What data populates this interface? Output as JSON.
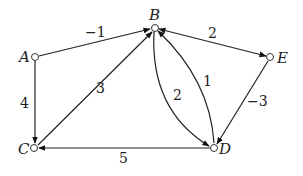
{
  "diagram": {
    "type": "directed weighted graph",
    "nodes": [
      {
        "id": "A",
        "label": "A",
        "x": 35,
        "y": 57
      },
      {
        "id": "B",
        "label": "B",
        "x": 155,
        "y": 28
      },
      {
        "id": "E",
        "label": "E",
        "x": 270,
        "y": 57
      },
      {
        "id": "C",
        "label": "C",
        "x": 34,
        "y": 148
      },
      {
        "id": "D",
        "label": "D",
        "x": 214,
        "y": 148
      }
    ],
    "edges": [
      {
        "from": "A",
        "to": "B",
        "weight": "−1"
      },
      {
        "from": "A",
        "to": "C",
        "weight": "4"
      },
      {
        "from": "C",
        "to": "B",
        "weight": "3"
      },
      {
        "from": "E",
        "to": "B",
        "weight": "2"
      },
      {
        "from": "B",
        "to": "D",
        "weight": "2"
      },
      {
        "from": "D",
        "to": "B",
        "weight": "1"
      },
      {
        "from": "E",
        "to": "D",
        "weight": "−3"
      },
      {
        "from": "D",
        "to": "C",
        "weight": "5"
      }
    ]
  }
}
